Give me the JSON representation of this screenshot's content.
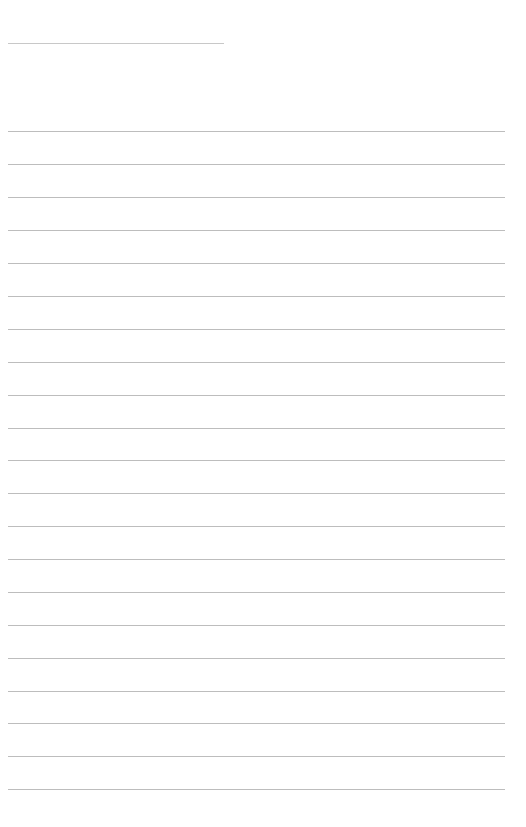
{
  "document": {
    "kind": "ruled-paper",
    "title_text": "",
    "background_color": "#ffffff",
    "width": 526,
    "height": 827
  },
  "title_rule": {
    "name": "title-rule",
    "x": 8,
    "y": 43,
    "width": 216,
    "thickness": 1,
    "color": "#c8c8c8"
  },
  "body_rules": {
    "name": "writing-lines",
    "count": 21,
    "x": 8,
    "width": 497,
    "first_y": 131,
    "spacing": 32.9,
    "thickness": 1,
    "color": "#bdbdbd",
    "lines": [
      {
        "y": 131,
        "text": ""
      },
      {
        "y": 164,
        "text": ""
      },
      {
        "y": 197,
        "text": ""
      },
      {
        "y": 230,
        "text": ""
      },
      {
        "y": 263,
        "text": ""
      },
      {
        "y": 296,
        "text": ""
      },
      {
        "y": 329,
        "text": ""
      },
      {
        "y": 362,
        "text": ""
      },
      {
        "y": 395,
        "text": ""
      },
      {
        "y": 428,
        "text": ""
      },
      {
        "y": 460,
        "text": ""
      },
      {
        "y": 493,
        "text": ""
      },
      {
        "y": 526,
        "text": ""
      },
      {
        "y": 559,
        "text": ""
      },
      {
        "y": 592,
        "text": ""
      },
      {
        "y": 625,
        "text": ""
      },
      {
        "y": 658,
        "text": ""
      },
      {
        "y": 691,
        "text": ""
      },
      {
        "y": 723,
        "text": ""
      },
      {
        "y": 756,
        "text": ""
      },
      {
        "y": 789,
        "text": ""
      }
    ]
  }
}
